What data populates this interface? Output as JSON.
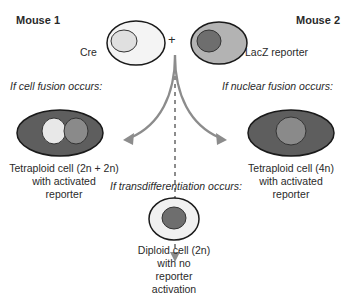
{
  "mouse1": {
    "title": "Mouse 1",
    "cell_label": "Cre"
  },
  "mouse2": {
    "title": "Mouse 2",
    "cell_label": "LacZ reporter"
  },
  "plus_sign": "+",
  "outcomes": {
    "cell_fusion": {
      "condition": "If cell fusion occurs:",
      "result_lines": [
        "Tetraploid cell (2n + 2n)",
        "with activated",
        "reporter"
      ]
    },
    "nuclear_fusion": {
      "condition": "If nuclear fusion occurs:",
      "result_lines": [
        "Tetraploid cell (4n)",
        "with activated",
        "reporter"
      ]
    },
    "transdifferentiation": {
      "condition": "If transdifferentiation occurs:",
      "result_lines": [
        "Diploid cell (2n)",
        "with no",
        "reporter",
        "activation"
      ]
    }
  },
  "colors": {
    "outline": "#1a1a1a",
    "cre_cytoplasm": "#f2f2f2",
    "cre_nucleus": "#e0e0e0",
    "lacz_cytoplasm": "#b3b3b3",
    "lacz_nucleus": "#6e6e6e",
    "activated_cytoplasm": "#5e5e5e",
    "light_nucleus": "#e8e8e8",
    "mid_nucleus": "#8a8a8a",
    "arrow": "#8c8c8c"
  }
}
